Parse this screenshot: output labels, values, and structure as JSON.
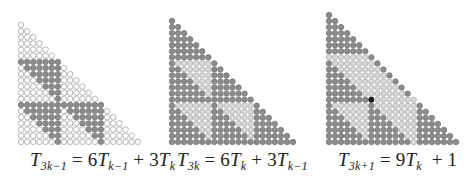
{
  "colors": {
    "white_fill": "#ffffff",
    "white_stroke": "#9a9a9a",
    "dark_fill": "#8c8c8c",
    "dark_stroke": "#6e6e6e",
    "light_fill": "#d9d9d9",
    "light_stroke": "#a8a8a8",
    "center_fill": "#1a1a1a"
  },
  "k": 7,
  "panels": [
    {
      "id": "panel-3k-minus-1",
      "rows": 20,
      "origin_x": 21,
      "origin_y": 25,
      "spacing": 6.15,
      "scheme": "A",
      "caption": {
        "lhs_symbol": "T",
        "lhs_sub": "3k−1",
        "eq": " = 6",
        "t1_symbol": "T",
        "t1_sub": "k−1",
        "plus": " + 3",
        "t2_symbol": "T",
        "t2_sub": "k",
        "tail": ""
      },
      "caption_left": 30
    },
    {
      "id": "panel-3k",
      "rows": 21,
      "origin_x": 172,
      "origin_y": 21,
      "spacing": 6.05,
      "scheme": "B",
      "caption": {
        "lhs_symbol": "T",
        "lhs_sub": "3k",
        "eq": " = 6",
        "t1_symbol": "T",
        "t1_sub": "k",
        "plus": " + 3",
        "t2_symbol": "T",
        "t2_sub": "k−1",
        "tail": ""
      },
      "caption_left": 177
    },
    {
      "id": "panel-3k-plus-1",
      "rows": 22,
      "origin_x": 329,
      "origin_y": 15,
      "spacing": 6.05,
      "scheme": "C",
      "caption": {
        "lhs_symbol": "T",
        "lhs_sub": "3k+1",
        "eq": " = 9",
        "t1_symbol": "T",
        "t1_sub": "k",
        "plus": "  + 1",
        "t2_symbol": "",
        "t2_sub": "",
        "tail": ""
      },
      "caption_left": 338
    }
  ]
}
